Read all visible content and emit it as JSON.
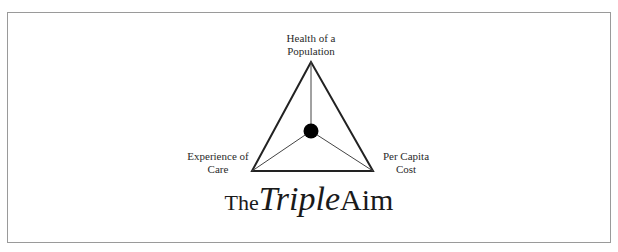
{
  "diagram": {
    "type": "triangle",
    "vertices": {
      "top": {
        "label": "Health of a Population",
        "line1": "Health of a",
        "line2": "Population"
      },
      "left": {
        "label": "Experience of Care",
        "line1": "Experience of",
        "line2": "Care"
      },
      "right": {
        "label": "Per Capita Cost",
        "line1": "Per Capita",
        "line2": "Cost"
      }
    },
    "center": {
      "shape": "filled-circle",
      "color": "#000000"
    },
    "title": {
      "prefix": "The",
      "emphasis": "Triple",
      "suffix": "Aim"
    },
    "colors": {
      "line": "#222222",
      "border": "#9a9a9a",
      "background": "#ffffff"
    }
  }
}
